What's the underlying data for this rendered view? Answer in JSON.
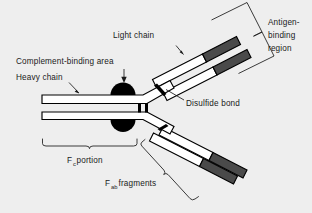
{
  "figure": {
    "background_color": "#eeeeee",
    "outline_color": "#000000",
    "variable_region_color": "#4a4a4a",
    "constant_region_color": "#ffffff",
    "text_color": "#1a1a1a"
  },
  "labels": {
    "light_chain": "Light chain",
    "complement_binding_area": "Complement-binding area",
    "heavy_chain": "Heavy chain",
    "disulfide_bond": "Disulfide bond",
    "antigen_binding_region_line1": "Antigen-",
    "antigen_binding_region_line2": "binding",
    "antigen_binding_region_line3": "region",
    "fc_portion_main": "F",
    "fc_portion_sub": "c",
    "fc_portion_tail": " portion",
    "fab_fragments_main": "F",
    "fab_fragments_sub": "ab",
    "fab_fragments_tail": " fragments"
  },
  "parts": {
    "heavy_chain_upper": "heavy-chain-upper-bar",
    "heavy_chain_lower": "heavy-chain-lower-bar",
    "light_chain_upper": "light-chain-upper-bar",
    "light_chain_lower": "light-chain-lower-bar",
    "fab_arm_upper_outer": "fab-arm-upper-outer",
    "fab_arm_lower_outer": "fab-arm-lower-outer",
    "complement_blob_top": "complement-binding-blob-top",
    "complement_blob_bottom": "complement-binding-blob-bottom",
    "hinge_disulfide_left": "hinge-disulfide-bar-left",
    "hinge_disulfide_right": "hinge-disulfide-bar-right",
    "arm_disulfide_upper": "arm-disulfide-bond-upper",
    "arm_disulfide_lower": "arm-disulfide-bond-lower"
  }
}
